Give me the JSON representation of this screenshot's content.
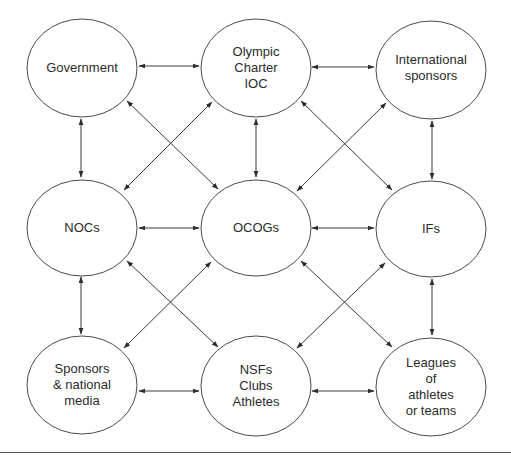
{
  "diagram": {
    "nodes": [
      {
        "id": "government",
        "lines": [
          "Government"
        ],
        "cx": 82,
        "cy": 68
      },
      {
        "id": "olympic",
        "lines": [
          "Olympic",
          "Charter",
          "IOC"
        ],
        "cx": 256,
        "cy": 68
      },
      {
        "id": "international",
        "lines": [
          "International",
          "sponsors"
        ],
        "cx": 431,
        "cy": 70
      },
      {
        "id": "nocs",
        "lines": [
          "NOCs"
        ],
        "cx": 82,
        "cy": 228
      },
      {
        "id": "ocogs",
        "lines": [
          "OCOGs"
        ],
        "cx": 256,
        "cy": 228
      },
      {
        "id": "ifs",
        "lines": [
          "IFs"
        ],
        "cx": 431,
        "cy": 229
      },
      {
        "id": "sponsors",
        "lines": [
          "Sponsors",
          "& national",
          "media"
        ],
        "cx": 82,
        "cy": 385
      },
      {
        "id": "nsfs",
        "lines": [
          "NSFs",
          "Clubs",
          "Athletes"
        ],
        "cx": 256,
        "cy": 386
      },
      {
        "id": "leagues",
        "lines": [
          "Leagues",
          "of",
          "athletes",
          "or teams"
        ],
        "cx": 431,
        "cy": 387
      }
    ],
    "edges": [
      {
        "from": "government",
        "to": "olympic",
        "type": "bidirectional"
      },
      {
        "from": "olympic",
        "to": "international",
        "type": "bidirectional"
      },
      {
        "from": "nocs",
        "to": "ocogs",
        "type": "bidirectional"
      },
      {
        "from": "ocogs",
        "to": "ifs",
        "type": "bidirectional"
      },
      {
        "from": "sponsors",
        "to": "nsfs",
        "type": "bidirectional"
      },
      {
        "from": "nsfs",
        "to": "leagues",
        "type": "bidirectional"
      },
      {
        "from": "government",
        "to": "nocs",
        "type": "bidirectional"
      },
      {
        "from": "olympic",
        "to": "ocogs",
        "type": "bidirectional"
      },
      {
        "from": "international",
        "to": "ifs",
        "type": "bidirectional"
      },
      {
        "from": "nocs",
        "to": "sponsors",
        "type": "bidirectional"
      },
      {
        "from": "ifs",
        "to": "leagues",
        "type": "bidirectional"
      },
      {
        "from": "government",
        "to": "ocogs",
        "type": "bidirectional"
      },
      {
        "from": "olympic",
        "to": "nocs",
        "type": "bidirectional"
      },
      {
        "from": "olympic",
        "to": "ifs",
        "type": "bidirectional"
      },
      {
        "from": "international",
        "to": "ocogs",
        "type": "bidirectional"
      },
      {
        "from": "nocs",
        "to": "nsfs",
        "type": "bidirectional"
      },
      {
        "from": "sponsors",
        "to": "ocogs",
        "type": "bidirectional"
      },
      {
        "from": "ocogs",
        "to": "leagues",
        "type": "bidirectional"
      },
      {
        "from": "nsfs",
        "to": "ifs",
        "type": "bidirectional"
      }
    ]
  },
  "labels": {
    "government": [
      "Government"
    ],
    "olympic": [
      "Olympic",
      "Charter",
      "IOC"
    ],
    "international": [
      "International",
      "sponsors"
    ],
    "nocs": [
      "NOCs"
    ],
    "ocogs": [
      "OCOGs"
    ],
    "ifs": [
      "IFs"
    ],
    "sponsors": [
      "Sponsors",
      "& national",
      "media"
    ],
    "nsfs": [
      "NSFs",
      "Clubs",
      "Athletes"
    ],
    "leagues": [
      "Leagues",
      "of",
      "athletes",
      "or teams"
    ]
  },
  "colors": {
    "stroke": "#4a4a4a",
    "text": "#2b2b2b",
    "background": "#ffffff"
  }
}
